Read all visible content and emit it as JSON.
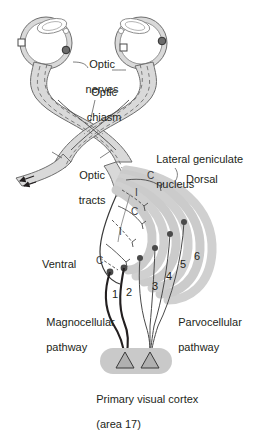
{
  "figure": {
    "background_color": "#ffffff",
    "ink_color": "#231f20",
    "tissue_fill": "#d9d9d9",
    "tissue_stroke": "#6e6e6e",
    "layer_fill": "#cfcfcf",
    "cortex_fill": "#c9c9c9"
  },
  "labels": {
    "optic_nerves": "Optic\nnerves",
    "optic_chiasm": "Optic\nchiasm",
    "optic_tracts": "Optic\ntracts",
    "lateral_geniculate_nucleus": "Lateral geniculate\nnucleus",
    "dorsal": "Dorsal",
    "ventral": "Ventral",
    "magnocellular_pathway": "Magnocellular\npathway",
    "parvocellular_pathway": "Parvocellular\npathway",
    "primary_visual_cortex": "Primary visual cortex\n(area 17)"
  },
  "label_lines": {
    "optic_nerves_line1": "Optic",
    "optic_nerves_line2": "nerves",
    "optic_chiasm_line1": "Optic",
    "optic_chiasm_line2": "chiasm",
    "optic_tracts_line1": "Optic",
    "optic_tracts_line2": "tracts",
    "lgn_line1": "Lateral geniculate",
    "lgn_line2": "nucleus",
    "magno_line1": "Magnocellular",
    "magno_line2": "pathway",
    "parvo_line1": "Parvocellular",
    "parvo_line2": "pathway",
    "cortex_line1": "Primary visual cortex",
    "cortex_line2": "(area 17)"
  },
  "lgn": {
    "description": "Lateral geniculate nucleus with six laminae",
    "eye_input_labels": [
      "C",
      "I",
      "C",
      "I",
      "C",
      "I"
    ],
    "eye_input_visible": [
      "C",
      "I",
      "C",
      "I",
      "C"
    ],
    "layer_numbers": [
      "1",
      "2",
      "3",
      "4",
      "5",
      "6"
    ],
    "magnocellular_layers": [
      "1",
      "2"
    ],
    "parvocellular_layers": [
      "3",
      "4",
      "5",
      "6"
    ],
    "contralateral_code": "C",
    "ipsilateral_code": "I",
    "orientation_top": "Dorsal",
    "orientation_bottom": "Ventral"
  },
  "eyes": {
    "left_eye_name": "left-eye",
    "right_eye_name": "right-eye",
    "retina_marker_open": "open-circle",
    "retina_marker_filled": "filled-circle"
  },
  "cortex": {
    "neuron_count": 2,
    "neuron_shape": "pyramidal-triangle"
  }
}
